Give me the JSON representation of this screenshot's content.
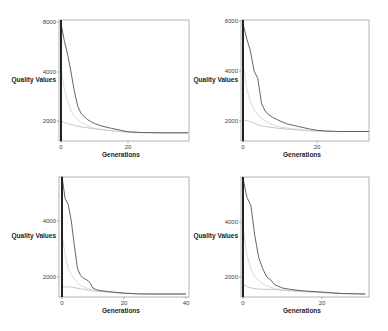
{
  "chart_data": [
    {
      "type": "line",
      "id": "top-left",
      "xlabel": "Generations",
      "ylabel": "Quality Values",
      "box": {
        "x0": 59,
        "y0": 20,
        "x1": 189,
        "y1": 141
      },
      "x_ticks": [
        {
          "v": 0,
          "px": 61
        },
        {
          "v": 20,
          "px": 128
        }
      ],
      "x_tick_labels": [
        "0",
        "20"
      ],
      "y_ticks": [
        {
          "v": 8000,
          "px": 22
        },
        {
          "v": 4000,
          "px": 72
        },
        {
          "v": 2000,
          "px": 121
        }
      ],
      "y_tick_labels": [
        "8000",
        "4000",
        "2000"
      ],
      "y_min_value": 1300,
      "xlim": [
        0,
        38
      ],
      "series": [
        {
          "name": "best (dark)",
          "color": "#555555",
          "width": 0.9,
          "x": [
            0,
            1,
            2,
            3,
            4,
            5,
            6,
            8,
            10,
            12,
            15,
            18,
            20,
            24,
            30,
            38
          ],
          "y": [
            7900,
            6500,
            5400,
            4000,
            3200,
            2600,
            2300,
            2050,
            1900,
            1800,
            1700,
            1620,
            1560,
            1530,
            1520,
            1520
          ]
        },
        {
          "name": "mean (light)",
          "color": "#c8c8c8",
          "width": 0.7,
          "x": [
            0,
            1,
            2,
            3,
            4,
            5,
            6,
            8,
            10,
            14,
            18,
            22,
            30,
            38
          ],
          "y": [
            4200,
            3300,
            2800,
            2400,
            2200,
            2050,
            1950,
            1800,
            1700,
            1620,
            1570,
            1540,
            1520,
            1520
          ]
        },
        {
          "name": "worst-of-best (flat)",
          "color": "#b0b0b0",
          "width": 0.7,
          "x": [
            0,
            2,
            4,
            6,
            10,
            14,
            18,
            22,
            30,
            38
          ],
          "y": [
            2000,
            1900,
            1820,
            1760,
            1680,
            1620,
            1570,
            1530,
            1520,
            1520
          ]
        }
      ]
    },
    {
      "type": "line",
      "id": "top-right",
      "xlabel": "Generations",
      "ylabel": "Quality Values",
      "box": {
        "x0": 241,
        "y0": 20,
        "x1": 369,
        "y1": 141
      },
      "x_ticks": [
        {
          "v": 0,
          "px": 243
        },
        {
          "v": 20,
          "px": 317
        }
      ],
      "x_tick_labels": [
        "0",
        "20"
      ],
      "y_ticks": [
        {
          "v": 6000,
          "px": 21
        },
        {
          "v": 4000,
          "px": 71
        },
        {
          "v": 2000,
          "px": 121
        }
      ],
      "y_tick_labels": [
        "6000",
        "4000",
        "2000"
      ],
      "y_min_value": 1300,
      "xlim": [
        0,
        34
      ],
      "series": [
        {
          "name": "best (dark)",
          "color": "#555555",
          "width": 0.9,
          "x": [
            0,
            1,
            2,
            3,
            4,
            5,
            6,
            7,
            8,
            10,
            12,
            15,
            18,
            20,
            22,
            26,
            34
          ],
          "y": [
            5900,
            5300,
            4800,
            4000,
            3700,
            2700,
            2400,
            2250,
            2150,
            2000,
            1880,
            1780,
            1680,
            1630,
            1600,
            1580,
            1580
          ]
        },
        {
          "name": "mean (light)",
          "color": "#c8c8c8",
          "width": 0.7,
          "x": [
            0,
            1,
            2,
            3,
            4,
            5,
            6,
            8,
            10,
            14,
            18,
            22,
            26,
            34
          ],
          "y": [
            4300,
            3300,
            2800,
            2450,
            2250,
            2100,
            2000,
            1850,
            1760,
            1680,
            1630,
            1600,
            1580,
            1580
          ]
        },
        {
          "name": "worst-of-best (flat)",
          "color": "#b0b0b0",
          "width": 0.7,
          "x": [
            0,
            2,
            4,
            6,
            10,
            14,
            18,
            22,
            26,
            34
          ],
          "y": [
            2050,
            1980,
            1850,
            1780,
            1700,
            1650,
            1610,
            1590,
            1580,
            1580
          ]
        }
      ]
    },
    {
      "type": "line",
      "id": "bottom-left",
      "xlabel": "Generations",
      "ylabel": "Quality Values",
      "box": {
        "x0": 59,
        "y0": 177,
        "x1": 189,
        "y1": 297
      },
      "x_ticks": [
        {
          "v": 0,
          "px": 62
        },
        {
          "v": 20,
          "px": 124
        },
        {
          "v": 40,
          "px": 186
        }
      ],
      "x_tick_labels": [
        "0",
        "20",
        "40"
      ],
      "y_ticks": [
        {
          "v": 4000,
          "px": 221
        },
        {
          "v": 2000,
          "px": 277
        }
      ],
      "y_tick_labels": [
        "4000",
        "2000"
      ],
      "y_min_value": 1300,
      "xlim": [
        0,
        40
      ],
      "series": [
        {
          "name": "best (dark)",
          "color": "#555555",
          "width": 0.9,
          "x": [
            0,
            1,
            2,
            3,
            4,
            5,
            6,
            7,
            8,
            9,
            10,
            11,
            12,
            15,
            20,
            25,
            30,
            35,
            40
          ],
          "y": [
            5600,
            4800,
            4600,
            4000,
            3100,
            2300,
            2050,
            1950,
            1900,
            1800,
            1600,
            1550,
            1520,
            1480,
            1420,
            1380,
            1370,
            1360,
            1350
          ]
        },
        {
          "name": "mean (light)",
          "color": "#c8c8c8",
          "width": 0.7,
          "x": [
            0,
            1,
            2,
            3,
            4,
            5,
            6,
            8,
            10,
            12,
            16,
            20,
            30,
            40
          ],
          "y": [
            3500,
            2800,
            2300,
            2100,
            1950,
            1800,
            1700,
            1600,
            1530,
            1500,
            1450,
            1420,
            1370,
            1350
          ]
        },
        {
          "name": "worst-of-best (flat)",
          "color": "#b0b0b0",
          "width": 0.7,
          "x": [
            0,
            3,
            6,
            10,
            14,
            20,
            30,
            40
          ],
          "y": [
            1650,
            1640,
            1580,
            1500,
            1460,
            1420,
            1370,
            1350
          ]
        }
      ]
    },
    {
      "type": "line",
      "id": "bottom-right",
      "xlabel": "Generations",
      "ylabel": "Quality Values",
      "box": {
        "x0": 241,
        "y0": 177,
        "x1": 369,
        "y1": 297
      },
      "x_ticks": [
        {
          "v": 0,
          "px": 243
        },
        {
          "v": 20,
          "px": 322
        }
      ],
      "x_tick_labels": [
        "0",
        "20"
      ],
      "y_ticks": [
        {
          "v": 4000,
          "px": 222
        },
        {
          "v": 2000,
          "px": 277
        }
      ],
      "y_tick_labels": [
        "4000",
        "2000"
      ],
      "y_min_value": 1300,
      "xlim": [
        0,
        31
      ],
      "series": [
        {
          "name": "best (dark)",
          "color": "#555555",
          "width": 0.9,
          "x": [
            0,
            1,
            2,
            3,
            4,
            5,
            6,
            7,
            8,
            10,
            12,
            15,
            20,
            25,
            31
          ],
          "y": [
            5600,
            4900,
            4600,
            3500,
            2700,
            2300,
            2000,
            1900,
            1720,
            1600,
            1550,
            1500,
            1450,
            1400,
            1380
          ]
        },
        {
          "name": "mean (light)",
          "color": "#c8c8c8",
          "width": 0.7,
          "x": [
            0,
            1,
            2,
            3,
            4,
            5,
            6,
            8,
            10,
            14,
            20,
            25,
            31
          ],
          "y": [
            3800,
            2800,
            2300,
            2000,
            1850,
            1750,
            1680,
            1580,
            1530,
            1480,
            1430,
            1400,
            1380
          ]
        },
        {
          "name": "worst-of-best (flat)",
          "color": "#b0b0b0",
          "width": 0.7,
          "x": [
            0,
            1,
            2,
            4,
            8,
            12,
            20,
            25,
            31
          ],
          "y": [
            1750,
            1650,
            1600,
            1560,
            1540,
            1500,
            1440,
            1400,
            1380
          ]
        }
      ]
    }
  ]
}
